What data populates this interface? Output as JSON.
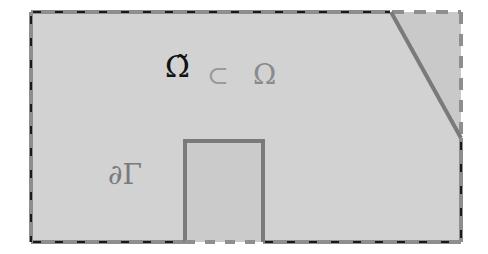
{
  "diagram": {
    "labels": {
      "omega_tilde": "Ω̃",
      "subset": "⊂",
      "omega": "Ω",
      "boundary_gamma": "∂Γ"
    },
    "colors": {
      "background": "#ffffff",
      "domain_fill": "#d2d2d2",
      "corner_fill": "#c8c8c8",
      "inner_rect_fill": "#cbcbcb",
      "solid_edge": "#7a7a7a",
      "dashed_gray": "#8e8e8e",
      "dashed_black": "#1a1a1a",
      "omega_tilde_text": "#111111",
      "omega_text": "#8a8a8a",
      "gamma_text": "#7a7a7a"
    }
  }
}
